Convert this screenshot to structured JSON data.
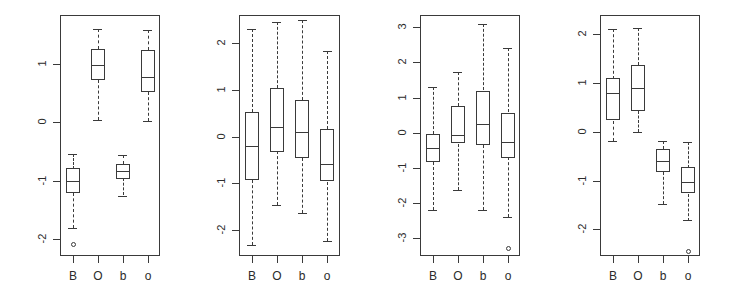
{
  "figure": {
    "width": 729,
    "height": 303,
    "background": "#ffffff",
    "stroke_color": "#3a3a3a",
    "panel_count": 4
  },
  "chart_data": [
    {
      "type": "box",
      "panel_index": 1,
      "title": "",
      "xlabel": "",
      "ylabel": "",
      "categories": [
        "B",
        "O",
        "b",
        "o"
      ],
      "yticks": [
        1,
        0,
        -1,
        -2
      ],
      "ylim": [
        -2.3,
        1.85
      ],
      "grid": false,
      "legend": "none",
      "boxes": [
        {
          "label": "B",
          "lower_whisker": -1.82,
          "q1": -1.22,
          "median": -1.0,
          "q3": -0.79,
          "upper_whisker": -0.54,
          "outliers": [
            -2.1
          ]
        },
        {
          "label": "O",
          "lower_whisker": 0.04,
          "q1": 0.73,
          "median": 0.99,
          "q3": 1.27,
          "upper_whisker": 1.61,
          "outliers": []
        },
        {
          "label": "b",
          "lower_whisker": -1.26,
          "q1": -0.96,
          "median": -0.83,
          "q3": -0.71,
          "upper_whisker": -0.56,
          "outliers": []
        },
        {
          "label": "o",
          "lower_whisker": 0.02,
          "q1": 0.52,
          "median": 0.78,
          "q3": 1.25,
          "upper_whisker": 1.6,
          "outliers": []
        }
      ]
    },
    {
      "type": "box",
      "panel_index": 2,
      "title": "",
      "xlabel": "",
      "ylabel": "",
      "categories": [
        "B",
        "O",
        "b",
        "o"
      ],
      "yticks": [
        2,
        1,
        0,
        -1,
        -2
      ],
      "ylim": [
        -2.55,
        2.6
      ],
      "grid": false,
      "legend": "none",
      "boxes": [
        {
          "label": "B",
          "lower_whisker": -2.32,
          "q1": -0.93,
          "median": -0.2,
          "q3": 0.52,
          "upper_whisker": 2.3,
          "outliers": []
        },
        {
          "label": "O",
          "lower_whisker": -1.47,
          "q1": -0.31,
          "median": 0.21,
          "q3": 1.05,
          "upper_whisker": 2.45,
          "outliers": []
        },
        {
          "label": "b",
          "lower_whisker": -1.63,
          "q1": -0.45,
          "median": 0.1,
          "q3": 0.78,
          "upper_whisker": 2.5,
          "outliers": []
        },
        {
          "label": "o",
          "lower_whisker": -2.22,
          "q1": -0.96,
          "median": -0.59,
          "q3": 0.16,
          "upper_whisker": 1.83,
          "outliers": []
        }
      ]
    },
    {
      "type": "box",
      "panel_index": 3,
      "title": "",
      "xlabel": "",
      "ylabel": "",
      "categories": [
        "B",
        "O",
        "b",
        "o"
      ],
      "yticks": [
        3,
        2,
        1,
        0,
        -1,
        -2,
        -3
      ],
      "ylim": [
        -3.5,
        3.35
      ],
      "grid": false,
      "legend": "none",
      "boxes": [
        {
          "label": "B",
          "lower_whisker": -2.18,
          "q1": -0.82,
          "median": -0.43,
          "q3": -0.03,
          "upper_whisker": 1.3,
          "outliers": []
        },
        {
          "label": "O",
          "lower_whisker": -1.62,
          "q1": -0.31,
          "median": -0.05,
          "q3": 0.75,
          "upper_whisker": 1.72,
          "outliers": []
        },
        {
          "label": "b",
          "lower_whisker": -2.18,
          "q1": -0.34,
          "median": 0.25,
          "q3": 1.2,
          "upper_whisker": 3.08,
          "outliers": []
        },
        {
          "label": "o",
          "lower_whisker": -2.4,
          "q1": -0.7,
          "median": -0.26,
          "q3": 0.57,
          "upper_whisker": 2.4,
          "outliers": [
            -3.27
          ]
        }
      ]
    },
    {
      "type": "box",
      "panel_index": 4,
      "title": "",
      "xlabel": "",
      "ylabel": "",
      "categories": [
        "B",
        "O",
        "b",
        "o"
      ],
      "yticks": [
        2,
        1,
        0,
        -1,
        -2
      ],
      "ylim": [
        -2.55,
        2.4
      ],
      "grid": false,
      "legend": "none",
      "boxes": [
        {
          "label": "B",
          "lower_whisker": -0.18,
          "q1": 0.23,
          "median": 0.79,
          "q3": 1.1,
          "upper_whisker": 2.12,
          "outliers": []
        },
        {
          "label": "O",
          "lower_whisker": 0.0,
          "q1": 0.43,
          "median": 0.9,
          "q3": 1.38,
          "upper_whisker": 2.14,
          "outliers": []
        },
        {
          "label": "b",
          "lower_whisker": -1.48,
          "q1": -0.82,
          "median": -0.6,
          "q3": -0.35,
          "upper_whisker": -0.18,
          "outliers": []
        },
        {
          "label": "o",
          "lower_whisker": -1.82,
          "q1": -1.27,
          "median": -1.02,
          "q3": -0.73,
          "upper_whisker": -0.2,
          "outliers": [
            -2.45
          ]
        }
      ]
    }
  ],
  "panels": [
    {
      "frame_left": 60,
      "frame_top": 15,
      "frame_width": 100,
      "frame_height": 241
    },
    {
      "frame_left": 239,
      "frame_top": 15,
      "frame_width": 101,
      "frame_height": 241
    },
    {
      "frame_left": 420,
      "frame_top": 15,
      "frame_width": 100,
      "frame_height": 241
    },
    {
      "frame_left": 600,
      "frame_top": 15,
      "frame_width": 100,
      "frame_height": 241
    }
  ]
}
